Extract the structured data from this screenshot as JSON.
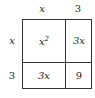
{
  "diagram": {
    "type": "area-model",
    "column_headers": [
      "x",
      "3"
    ],
    "row_headers": [
      "x",
      "3"
    ],
    "cells": [
      [
        "x²",
        "3x"
      ],
      [
        "3x",
        "9"
      ]
    ]
  }
}
